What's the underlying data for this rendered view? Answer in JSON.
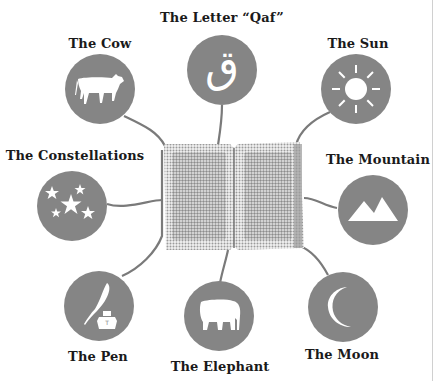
{
  "diagram": {
    "center": {
      "name": "Open Book (Quran)",
      "icon": "open-book-icon"
    },
    "nodes": [
      {
        "id": "cow",
        "label": "The Cow",
        "icon": "cow-icon"
      },
      {
        "id": "qaf",
        "label": "The Letter “Qaf”",
        "icon": "arabic-letter-qaf-icon",
        "glyph": "ق"
      },
      {
        "id": "sun",
        "label": "The Sun",
        "icon": "sun-icon"
      },
      {
        "id": "constellations",
        "label": "The Constellations",
        "icon": "stars-icon"
      },
      {
        "id": "mountain",
        "label": "The Mountain",
        "icon": "mountain-icon"
      },
      {
        "id": "pen",
        "label": "The Pen",
        "icon": "quill-ink-icon"
      },
      {
        "id": "elephant",
        "label": "The Elephant",
        "icon": "elephant-icon"
      },
      {
        "id": "moon",
        "label": "The Moon",
        "icon": "crescent-moon-icon"
      }
    ],
    "colors": {
      "node_fill": "#858585",
      "connector": "#7a7a7a",
      "icon": "#ffffff",
      "label": "#1a1a1a"
    }
  }
}
